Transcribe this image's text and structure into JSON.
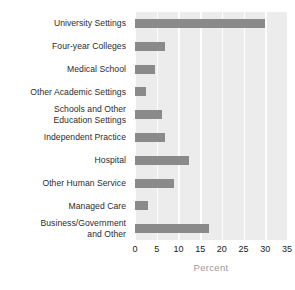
{
  "chart_data": {
    "type": "bar",
    "orientation": "horizontal",
    "title": "",
    "xlabel": "Percent",
    "ylabel": "",
    "xlim": [
      0,
      35
    ],
    "xticks": [
      0,
      5,
      10,
      15,
      20,
      25,
      30,
      35
    ],
    "grid": true,
    "legend": null,
    "categories": [
      "University Settings",
      "Four-year Colleges",
      "Medical School",
      "Other Academic Settings",
      "Schools and Other\nEducation Settings",
      "Independent Practice",
      "Hospital",
      "Other Human Service",
      "Managed Care",
      "Business/Government\nand Other"
    ],
    "values": [
      30.0,
      7.0,
      4.5,
      2.5,
      6.2,
      7.0,
      12.5,
      9.0,
      3.0,
      17.0
    ]
  },
  "colors": {
    "bar": "#8a8a8a",
    "plot_background": "#ececec",
    "gridline": "#fdfdfd",
    "label_text": "#2b2b2b",
    "tick_text": "#222222",
    "axis_title_text": "#9a9a9a",
    "page_background": "#ffffff"
  }
}
